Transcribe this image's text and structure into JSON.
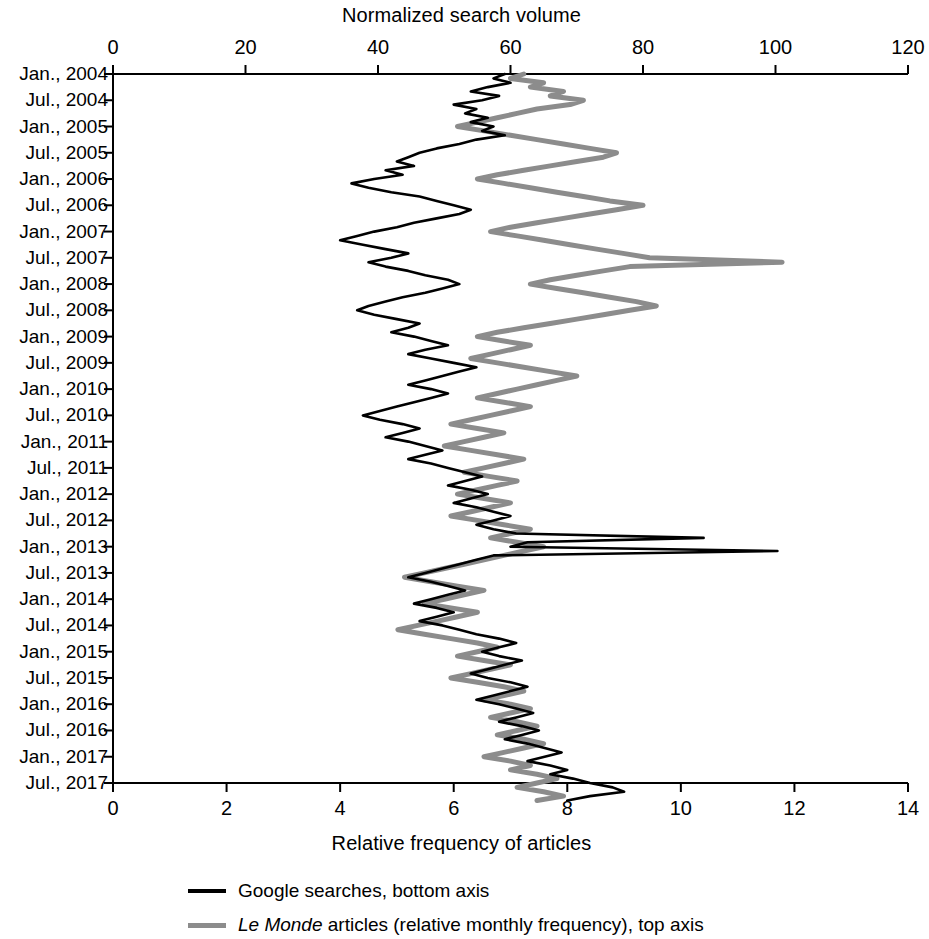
{
  "chart_data": {
    "type": "line",
    "title": "",
    "orientation": "horizontal-time-vertical",
    "top_axis": {
      "label": "Normalized search volume",
      "ticks": [
        0,
        20,
        40,
        60,
        80,
        100,
        120
      ],
      "range": [
        0,
        120
      ],
      "series": "Le Monde articles (relative monthly frequency), top axis"
    },
    "bottom_axis": {
      "label": "Relative frequency of articles",
      "ticks": [
        0,
        2,
        4,
        6,
        8,
        10,
        12,
        14
      ],
      "range": [
        0,
        14
      ],
      "series": "Google searches, bottom axis"
    },
    "y_axis": {
      "label": "",
      "tick_labels": [
        "Jan., 2004",
        "Jul., 2004",
        "Jan., 2005",
        "Jul., 2005",
        "Jan., 2006",
        "Jul., 2006",
        "Jan., 2007",
        "Jul., 2007",
        "Jan., 2008",
        "Jul., 2008",
        "Jan., 2009",
        "Jul., 2009",
        "Jan., 2010",
        "Jul., 2010",
        "Jan., 2011",
        "Jul., 2011",
        "Jan., 2012",
        "Jul., 2012",
        "Jan., 2013",
        "Jul., 2013",
        "Jan., 2014",
        "Jul., 2014",
        "Jan., 2015",
        "Jul., 2015",
        "Jan., 2016",
        "Jul., 2016",
        "Jan., 2017",
        "Jul., 2017"
      ],
      "start": "Jan., 2004",
      "end": "Jul., 2017",
      "months_total": 163
    },
    "grid": false,
    "legend_position": "below",
    "colors": {
      "google": "#000000",
      "lemonde": "#8c8c8c"
    },
    "series": [
      {
        "name": "Google searches, bottom axis",
        "axis": "bottom",
        "color": "#000000",
        "values": [
          6.9,
          6.7,
          7.0,
          6.6,
          6.3,
          6.8,
          6.5,
          6.0,
          6.4,
          6.2,
          6.6,
          6.3,
          6.7,
          6.5,
          6.9,
          6.4,
          6.1,
          5.7,
          5.4,
          5.2,
          5.0,
          5.3,
          4.8,
          5.1,
          4.6,
          4.2,
          4.5,
          4.9,
          5.4,
          5.7,
          6.0,
          6.3,
          6.1,
          5.7,
          5.3,
          5.0,
          4.6,
          4.3,
          4.0,
          4.4,
          4.8,
          5.2,
          4.9,
          4.5,
          4.8,
          5.2,
          5.5,
          5.9,
          6.1,
          5.8,
          5.5,
          5.1,
          4.8,
          4.5,
          4.3,
          4.6,
          5.0,
          5.4,
          5.2,
          4.9,
          5.3,
          5.6,
          5.9,
          5.5,
          5.2,
          5.6,
          6.0,
          6.4,
          6.1,
          5.8,
          5.5,
          5.2,
          5.6,
          5.9,
          5.6,
          5.3,
          5.0,
          4.7,
          4.4,
          4.7,
          5.1,
          5.4,
          5.1,
          4.8,
          5.2,
          5.5,
          5.8,
          5.5,
          5.2,
          5.6,
          5.9,
          6.2,
          6.5,
          6.2,
          5.9,
          6.3,
          6.6,
          6.3,
          6.0,
          6.4,
          6.7,
          7.0,
          6.7,
          6.4,
          6.7,
          7.1,
          10.4,
          7.3,
          7.0,
          11.7,
          6.7,
          6.4,
          6.1,
          5.8,
          5.5,
          5.2,
          5.6,
          5.9,
          6.2,
          5.9,
          5.6,
          5.3,
          5.7,
          6.0,
          5.7,
          5.4,
          5.8,
          6.1,
          6.4,
          6.8,
          7.1,
          6.8,
          6.5,
          6.8,
          7.2,
          6.9,
          6.6,
          6.3,
          6.6,
          7.0,
          7.3,
          7.0,
          6.7,
          6.4,
          6.8,
          7.1,
          7.4,
          7.1,
          6.8,
          7.2,
          7.5,
          7.2,
          6.9,
          7.3,
          7.6,
          7.9,
          7.6,
          7.3,
          7.7,
          8.0,
          7.7,
          8.1,
          8.4,
          8.8,
          9.0,
          8.4,
          8.0
        ]
      },
      {
        "name": "Le Monde articles (relative monthly frequency), top axis",
        "axis": "top",
        "color": "#8c8c8c",
        "values": [
          62,
          60,
          65,
          63,
          68,
          66,
          71,
          69,
          64,
          61,
          58,
          55,
          52,
          56,
          60,
          64,
          68,
          72,
          76,
          74,
          70,
          66,
          62,
          58,
          55,
          59,
          63,
          67,
          71,
          75,
          80,
          76,
          72,
          68,
          64,
          60,
          57,
          61,
          65,
          69,
          73,
          77,
          81,
          101,
          78,
          74,
          70,
          66,
          63,
          67,
          71,
          75,
          79,
          82,
          78,
          74,
          70,
          66,
          62,
          58,
          55,
          59,
          63,
          60,
          57,
          54,
          58,
          62,
          66,
          70,
          67,
          64,
          61,
          58,
          55,
          59,
          63,
          60,
          57,
          54,
          51,
          55,
          59,
          56,
          53,
          50,
          54,
          58,
          62,
          59,
          56,
          53,
          57,
          61,
          58,
          55,
          52,
          56,
          60,
          57,
          54,
          51,
          55,
          59,
          63,
          60,
          57,
          61,
          65,
          62,
          59,
          56,
          53,
          50,
          47,
          44,
          48,
          52,
          56,
          53,
          50,
          47,
          51,
          55,
          52,
          49,
          46,
          43,
          47,
          51,
          55,
          58,
          55,
          52,
          56,
          60,
          57,
          54,
          51,
          55,
          59,
          62,
          59,
          56,
          60,
          63,
          60,
          57,
          61,
          64,
          61,
          58,
          62,
          65,
          62,
          59,
          56,
          60,
          63,
          60,
          64,
          67,
          64,
          61,
          65,
          68,
          64
        ]
      }
    ]
  },
  "top_axis_title": "Normalized search volume",
  "bottom_axis_title": "Relative frequency of articles",
  "legend": {
    "google": "Google searches, bottom axis",
    "lemonde_italic": "Le Monde",
    "lemonde_rest": " articles (relative monthly frequency), top axis"
  }
}
